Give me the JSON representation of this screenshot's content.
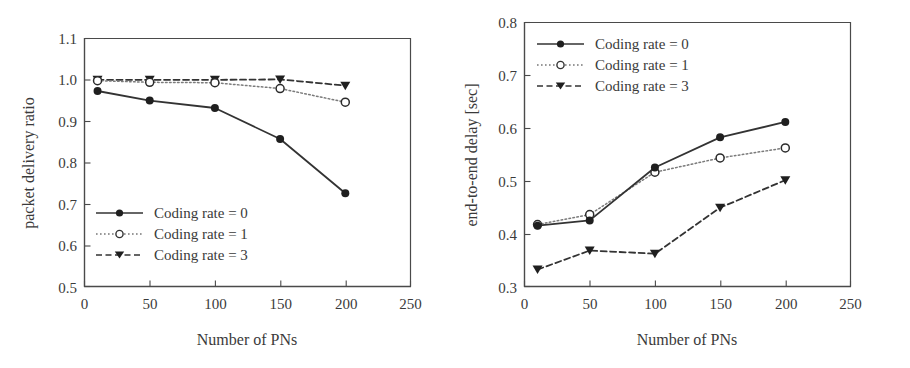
{
  "figure": {
    "panels": [
      {
        "id": "packet-delivery-ratio",
        "chart_data": {
          "type": "line",
          "title": "",
          "xlabel": "Number of PNs",
          "ylabel": "packet delivery ratio",
          "xlim": [
            0,
            250
          ],
          "ylim": [
            0.5,
            1.1
          ],
          "xticks": [
            "0",
            "50",
            "100",
            "150",
            "200",
            "250"
          ],
          "xtick_values": [
            0,
            50,
            100,
            150,
            200,
            250
          ],
          "yticks": [
            "0.5",
            "0.6",
            "0.7",
            "0.8",
            "0.9",
            "1.0",
            "1.1"
          ],
          "ytick_values": [
            0.5,
            0.6,
            0.7,
            0.8,
            0.9,
            1.0,
            1.1
          ],
          "grid": false,
          "legend_position": "lower-left-inside",
          "x": [
            10,
            50,
            100,
            150,
            200
          ],
          "series": [
            {
              "name": "Coding rate = 0",
              "values": [
                0.972,
                0.949,
                0.931,
                0.856,
                0.725
              ],
              "style": "solid",
              "marker": "filled-circle",
              "color": "#333333"
            },
            {
              "name": "Coding rate = 1",
              "values": [
                0.997,
                0.993,
                0.992,
                0.978,
                0.945
              ],
              "style": "dotted",
              "marker": "open-circle",
              "color": "#555555"
            },
            {
              "name": "Coding rate = 3",
              "values": [
                0.999,
                0.999,
                0.999,
                1.0,
                0.985
              ],
              "style": "dashed",
              "marker": "filled-triangle-down",
              "color": "#333333"
            }
          ]
        }
      },
      {
        "id": "end-to-end-delay",
        "chart_data": {
          "type": "line",
          "title": "",
          "xlabel": "Number of PNs",
          "ylabel": "end-to-end delay [sec]",
          "xlim": [
            0,
            250
          ],
          "ylim": [
            0.3,
            0.8
          ],
          "xticks": [
            "0",
            "50",
            "100",
            "150",
            "200",
            "250"
          ],
          "xtick_values": [
            0,
            50,
            100,
            150,
            200,
            250
          ],
          "yticks": [
            "0.3",
            "0.4",
            "0.5",
            "0.6",
            "0.7",
            "0.8"
          ],
          "ytick_values": [
            0.3,
            0.4,
            0.5,
            0.6,
            0.7,
            0.8
          ],
          "grid": false,
          "legend_position": "upper-left-inside",
          "x": [
            10,
            50,
            100,
            150,
            200
          ],
          "series": [
            {
              "name": "Coding rate = 0",
              "values": [
                0.415,
                0.425,
                0.525,
                0.582,
                0.611
              ],
              "style": "solid",
              "marker": "filled-circle",
              "color": "#333333"
            },
            {
              "name": "Coding rate = 1",
              "values": [
                0.417,
                0.436,
                0.516,
                0.543,
                0.562
              ],
              "style": "dotted",
              "marker": "open-circle",
              "color": "#555555"
            },
            {
              "name": "Coding rate = 3",
              "values": [
                0.332,
                0.368,
                0.362,
                0.449,
                0.501
              ],
              "style": "dashed",
              "marker": "filled-triangle-down",
              "color": "#333333"
            }
          ]
        }
      }
    ]
  }
}
